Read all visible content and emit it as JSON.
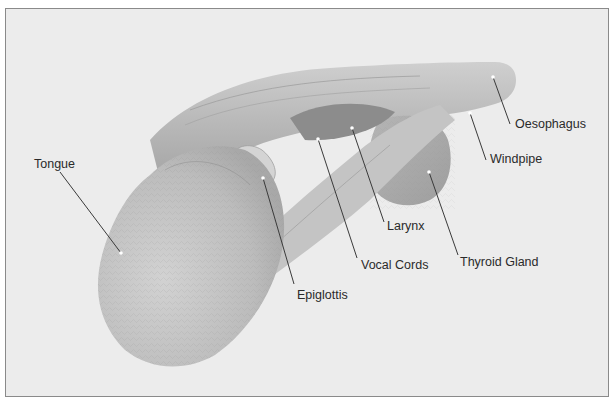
{
  "figure": {
    "colors": {
      "background": "#ececec",
      "frame_border": "#8a8a8a",
      "leader_line": "#3a3a3a",
      "label_text": "#2a2a2a"
    },
    "labels": [
      {
        "id": "tongue",
        "text": "Tongue",
        "label_x": 34,
        "label_y": 157,
        "line": [
          [
            60,
            172
          ],
          [
            121,
            253
          ]
        ]
      },
      {
        "id": "epiglottis",
        "text": "Epiglottis",
        "label_x": 297,
        "label_y": 288,
        "line": [
          [
            294,
            284
          ],
          [
            263,
            178
          ]
        ]
      },
      {
        "id": "vocal-cords",
        "text": "Vocal Cords",
        "label_x": 361,
        "label_y": 258,
        "line": [
          [
            357,
            258
          ],
          [
            318,
            139
          ]
        ]
      },
      {
        "id": "larynx",
        "text": "Larynx",
        "label_x": 387,
        "label_y": 219,
        "line": [
          [
            384,
            222
          ],
          [
            352,
            128
          ]
        ]
      },
      {
        "id": "thyroid-gland",
        "text": "Thyroid Gland",
        "label_x": 460,
        "label_y": 255,
        "line": [
          [
            458,
            255
          ],
          [
            429,
            172
          ]
        ]
      },
      {
        "id": "windpipe",
        "text": "Windpipe",
        "label_x": 490,
        "label_y": 152,
        "line": [
          [
            486,
            160
          ],
          [
            470,
            113
          ]
        ]
      },
      {
        "id": "oesophagus",
        "text": "Oesophagus",
        "label_x": 515,
        "label_y": 117,
        "line": [
          [
            510,
            124
          ],
          [
            493,
            77
          ]
        ]
      }
    ]
  }
}
